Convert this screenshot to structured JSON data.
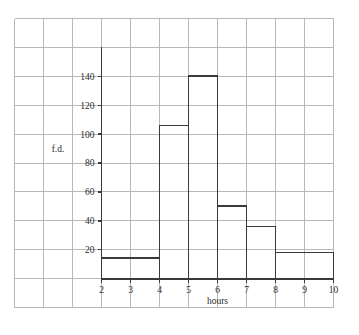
{
  "chart_data": {
    "type": "bar",
    "title": "",
    "subtitle": "",
    "xlabel": "hours",
    "ylabel": "f.d.",
    "grid": true,
    "legend": "none",
    "xlim": [
      2,
      10
    ],
    "ylim": [
      0,
      160
    ],
    "x_ticks": [
      "2",
      "3",
      "4",
      "5",
      "6",
      "7",
      "8",
      "9",
      "10"
    ],
    "x_tick_values": [
      2,
      3,
      4,
      5,
      6,
      7,
      8,
      9,
      10
    ],
    "y_ticks": [
      "20",
      "40",
      "60",
      "80",
      "100",
      "120",
      "140"
    ],
    "y_tick_values": [
      20,
      40,
      60,
      80,
      100,
      120,
      140
    ],
    "bins": [
      {
        "label": "2-4",
        "start": 2,
        "end": 4,
        "value": 14
      },
      {
        "label": "4-5",
        "start": 4,
        "end": 5,
        "value": 106
      },
      {
        "label": "5-6",
        "start": 5,
        "end": 6,
        "value": 140
      },
      {
        "label": "6-7",
        "start": 6,
        "end": 7,
        "value": 50
      },
      {
        "label": "7-8",
        "start": 7,
        "end": 8,
        "value": 36
      },
      {
        "label": "8-10",
        "start": 8,
        "end": 10,
        "value": 18
      }
    ],
    "categories": [
      "2-4",
      "4-5",
      "5-6",
      "6-7",
      "7-8",
      "8-10"
    ],
    "values": [
      14,
      106,
      140,
      50,
      36,
      18
    ],
    "colors": {
      "background": "#ffffff",
      "grid": "#b8b8b8",
      "axis": "#3a3a3a",
      "bar_outline": "#3a3a3a",
      "bar_fill": "none",
      "text": "#2a2a2a"
    }
  }
}
